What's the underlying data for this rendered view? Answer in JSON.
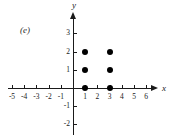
{
  "figure": {
    "panel_label": "(e)",
    "background_color": "#ffffff",
    "ink_color": "#1a1a1a"
  },
  "axes": {
    "x_name": "x",
    "y_name": "y",
    "x_ticks": [
      "-5",
      "-4",
      "-3",
      "-2",
      "-1",
      "1",
      "2",
      "3",
      "4",
      "5",
      "6"
    ],
    "y_ticks": [
      "3",
      "2",
      "1",
      "-1",
      "-2"
    ]
  },
  "chart_data": {
    "type": "scatter",
    "title": "(e)",
    "xlabel": "x",
    "ylabel": "y",
    "xlim": [
      -5.8,
      6.8
    ],
    "ylim": [
      -2.6,
      3.6
    ],
    "xticks": [
      -5,
      -4,
      -3,
      -2,
      -1,
      1,
      2,
      3,
      4,
      5,
      6
    ],
    "yticks": [
      3,
      2,
      1,
      -1,
      -2
    ],
    "grid": false,
    "legend": "none",
    "marker": "filled-circle",
    "marker_color": "#000000",
    "points": [
      {
        "x": 1,
        "y": 0
      },
      {
        "x": 1,
        "y": 1
      },
      {
        "x": 1,
        "y": 2
      },
      {
        "x": 3,
        "y": 0
      },
      {
        "x": 3,
        "y": 1
      },
      {
        "x": 3,
        "y": 2
      }
    ]
  }
}
